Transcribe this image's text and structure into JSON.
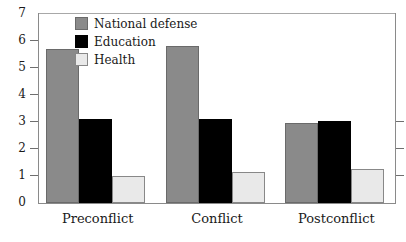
{
  "chart_data": {
    "type": "bar",
    "title": "",
    "subtitle": "",
    "xlabel": "",
    "ylabel": "",
    "categories": [
      "Preconflict",
      "Conflict",
      "Postconflict"
    ],
    "series": [
      {
        "name": "National defense",
        "color": "#8a8a8a",
        "values": [
          5.7,
          5.8,
          2.95
        ]
      },
      {
        "name": "Education",
        "color": "#000000",
        "values": [
          3.1,
          3.1,
          3.05
        ]
      },
      {
        "name": "Health",
        "color": "#e9e9e9",
        "values": [
          1.0,
          1.15,
          1.25
        ]
      }
    ],
    "ylim": [
      0,
      7
    ],
    "yticks": [
      0,
      1,
      2,
      3,
      4,
      5,
      6,
      7
    ],
    "ytick_labels": [
      "0",
      "1",
      "2",
      "3",
      "4",
      "5",
      "6",
      "7"
    ],
    "grid": false,
    "legend_position": "inside-top-left"
  }
}
